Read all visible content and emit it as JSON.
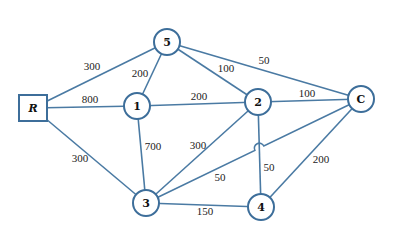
{
  "diagram": {
    "type": "weighted-network-graph",
    "colors": {
      "edge": "#4a7aa3",
      "node_border": "#3d6e9a",
      "node_fill": "#ffffff",
      "text": "#111111"
    },
    "nodes": [
      {
        "id": "R",
        "label": "R",
        "shape": "square",
        "x": 33,
        "y": 108
      },
      {
        "id": "5",
        "label": "5",
        "shape": "circle",
        "x": 167,
        "y": 42
      },
      {
        "id": "1",
        "label": "1",
        "shape": "circle",
        "x": 137,
        "y": 106
      },
      {
        "id": "2",
        "label": "2",
        "shape": "circle",
        "x": 258,
        "y": 102
      },
      {
        "id": "C",
        "label": "C",
        "shape": "circle",
        "x": 361,
        "y": 99
      },
      {
        "id": "3",
        "label": "3",
        "shape": "circle",
        "x": 146,
        "y": 203
      },
      {
        "id": "4",
        "label": "4",
        "shape": "circle",
        "x": 261,
        "y": 207
      }
    ],
    "edges": [
      {
        "from": "R",
        "to": "5",
        "weight": "300",
        "label_x": 92,
        "label_y": 66
      },
      {
        "from": "R",
        "to": "1",
        "weight": "800",
        "label_x": 90,
        "label_y": 99
      },
      {
        "from": "R",
        "to": "3",
        "weight": "300",
        "label_x": 80,
        "label_y": 158
      },
      {
        "from": "5",
        "to": "1",
        "weight": "200",
        "label_x": 140,
        "label_y": 73
      },
      {
        "from": "5",
        "to": "2",
        "weight": "100",
        "label_x": 226,
        "label_y": 68
      },
      {
        "from": "5",
        "to": "C",
        "weight": "50",
        "label_x": 264,
        "label_y": 60
      },
      {
        "from": "1",
        "to": "2",
        "weight": "200",
        "label_x": 199,
        "label_y": 96
      },
      {
        "from": "1",
        "to": "3",
        "weight": "700",
        "label_x": 153,
        "label_y": 146
      },
      {
        "from": "2",
        "to": "C",
        "weight": "100",
        "label_x": 307,
        "label_y": 93
      },
      {
        "from": "2",
        "to": "3",
        "weight": "300",
        "label_x": 198,
        "label_y": 145
      },
      {
        "from": "2",
        "to": "4",
        "weight": "50",
        "label_x": 269,
        "label_y": 167
      },
      {
        "from": "3",
        "to": "C",
        "weight": "50",
        "label_x": 220,
        "label_y": 177
      },
      {
        "from": "3",
        "to": "4",
        "weight": "150",
        "label_x": 205,
        "label_y": 211
      },
      {
        "from": "4",
        "to": "C",
        "weight": "200",
        "label_x": 321,
        "label_y": 159
      }
    ]
  }
}
